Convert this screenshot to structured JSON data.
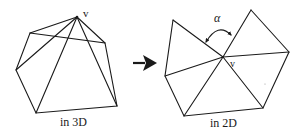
{
  "figure": {
    "left_panel": {
      "caption": "in 3D",
      "vertex_label": "v",
      "vertex": [
        77,
        17
      ],
      "ring": [
        [
          30,
          33
        ],
        [
          105,
          43
        ],
        [
          117,
          106
        ],
        [
          36,
          113
        ],
        [
          16,
          70
        ]
      ],
      "spokes_to": [
        [
          30,
          33
        ],
        [
          105,
          43
        ],
        [
          117,
          106
        ],
        [
          36,
          113
        ],
        [
          16,
          70
        ]
      ],
      "extra_edges": [
        [
          [
            30,
            33
          ],
          [
            105,
            43
          ]
        ]
      ]
    },
    "arrow": {
      "from": [
        133,
        63
      ],
      "to": [
        156,
        63
      ],
      "direction": "right"
    },
    "right_panel": {
      "caption": "in 2D",
      "vertex_label": "v",
      "angle_label": "α",
      "vertex": [
        223,
        57
      ],
      "ring": [
        [
          173,
          20
        ],
        [
          165,
          76
        ],
        [
          184,
          116
        ],
        [
          263,
          108
        ],
        [
          289,
          52
        ],
        [
          251,
          10
        ]
      ],
      "gap_between": [
        [
          173,
          20
        ],
        [
          251,
          10
        ]
      ]
    }
  }
}
